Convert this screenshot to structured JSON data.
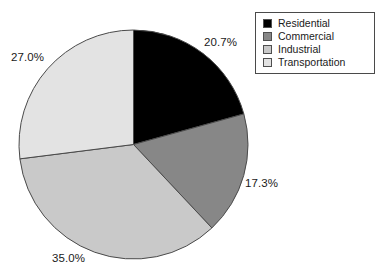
{
  "chart_data": {
    "type": "pie",
    "title": "",
    "subtitle": "",
    "xlabel": "",
    "ylabel": "",
    "grid": false,
    "legend_position": "top-right",
    "start_angle_deg": 0,
    "direction": "clockwise",
    "categories": [
      "Residential",
      "Commercial",
      "Industrial",
      "Transportation"
    ],
    "values": [
      20.7,
      17.3,
      35.0,
      27.0
    ],
    "value_unit": "%",
    "data_labels": [
      "20.7%",
      "17.3%",
      "35.0%",
      "27.0%"
    ],
    "colors": [
      "#000000",
      "#878787",
      "#c9c9c9",
      "#e3e3e3"
    ],
    "slices": [
      {
        "label": "Residential",
        "value": 20.7,
        "data_label": "20.7%",
        "color": "#000000"
      },
      {
        "label": "Commercial",
        "value": 17.3,
        "data_label": "17.3%",
        "color": "#878787"
      },
      {
        "label": "Industrial",
        "value": 35.0,
        "data_label": "35.0%",
        "color": "#c9c9c9"
      },
      {
        "label": "Transportation",
        "value": 27.0,
        "data_label": "27.0%",
        "color": "#e3e3e3"
      }
    ]
  },
  "legend": {
    "items": [
      {
        "label": "Residential",
        "color": "#000000"
      },
      {
        "label": "Commercial",
        "color": "#878787"
      },
      {
        "label": "Industrial",
        "color": "#c9c9c9"
      },
      {
        "label": "Transportation",
        "color": "#e3e3e3"
      }
    ]
  },
  "labels": {
    "residential": "20.7%",
    "commercial": "17.3%",
    "industrial": "35.0%",
    "transportation": "27.0%"
  },
  "style": {
    "slice_outline": "#4a4a4a",
    "legend_border": "#4a4a4a",
    "background": "#ffffff",
    "text_color": "#1a1a1a"
  }
}
